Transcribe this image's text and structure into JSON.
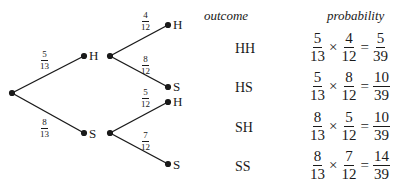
{
  "headers": {
    "outcome": "outcome",
    "probability": "probability"
  },
  "tree": {
    "first": [
      {
        "node": "H",
        "prob": {
          "num": "5",
          "den": "13"
        }
      },
      {
        "node": "S",
        "prob": {
          "num": "8",
          "den": "13"
        }
      }
    ],
    "second": [
      {
        "parent": "H",
        "node": "H",
        "prob": {
          "num": "4",
          "den": "12"
        }
      },
      {
        "parent": "H",
        "node": "S",
        "prob": {
          "num": "8",
          "den": "12"
        }
      },
      {
        "parent": "S",
        "node": "H",
        "prob": {
          "num": "5",
          "den": "12"
        }
      },
      {
        "parent": "S",
        "node": "S",
        "prob": {
          "num": "7",
          "den": "12"
        }
      }
    ]
  },
  "rows": [
    {
      "outcome": "HH",
      "a": {
        "num": "5",
        "den": "13"
      },
      "b": {
        "num": "4",
        "den": "12"
      },
      "r": {
        "num": "5",
        "den": "39"
      }
    },
    {
      "outcome": "HS",
      "a": {
        "num": "5",
        "den": "13"
      },
      "b": {
        "num": "8",
        "den": "12"
      },
      "r": {
        "num": "10",
        "den": "39"
      }
    },
    {
      "outcome": "SH",
      "a": {
        "num": "8",
        "den": "13"
      },
      "b": {
        "num": "5",
        "den": "12"
      },
      "r": {
        "num": "10",
        "den": "39"
      }
    },
    {
      "outcome": "SS",
      "a": {
        "num": "8",
        "den": "13"
      },
      "b": {
        "num": "7",
        "den": "12"
      },
      "r": {
        "num": "14",
        "den": "39"
      }
    }
  ],
  "symbols": {
    "times": "×",
    "equals": "="
  }
}
